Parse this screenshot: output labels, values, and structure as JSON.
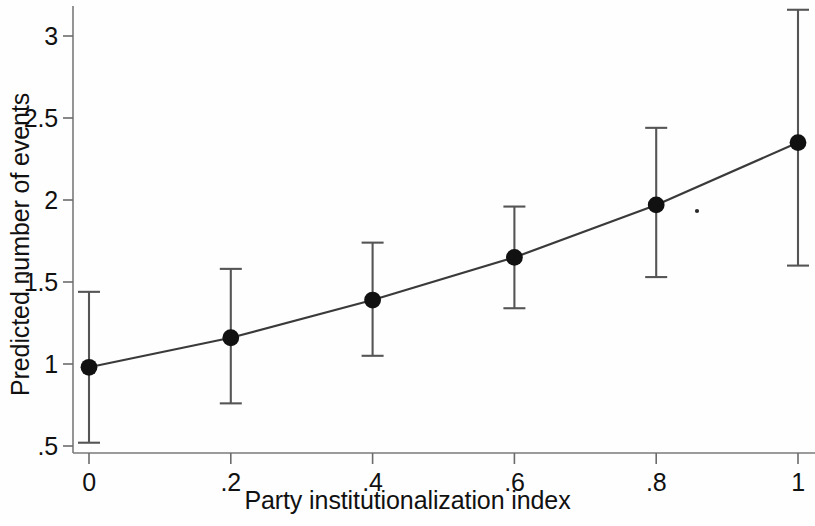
{
  "chart_data": {
    "type": "line",
    "title": "",
    "subtitle": "",
    "xlabel": "Party institutionalization index",
    "ylabel": "Predicted number of events",
    "x": [
      0,
      0.2,
      0.4,
      0.6,
      0.8,
      1
    ],
    "xtick_labels": [
      "0",
      ".2",
      ".4",
      ".6",
      ".8",
      "1"
    ],
    "ytick_labels": [
      ".5",
      "1",
      "1.5",
      "2",
      "2.5",
      "3"
    ],
    "ytick_values": [
      0.5,
      1,
      1.5,
      2,
      2.5,
      3
    ],
    "values": [
      0.98,
      1.16,
      1.39,
      1.65,
      1.97,
      2.35
    ],
    "error_low": [
      0.52,
      0.76,
      1.05,
      1.34,
      1.53,
      1.6
    ],
    "error_high": [
      1.44,
      1.58,
      1.74,
      1.96,
      2.44,
      3.16
    ],
    "xlim": [
      -0.055,
      1.04
    ],
    "ylim": [
      0.44,
      3.2
    ],
    "grid": false,
    "legend": null,
    "marker": "filled-circle",
    "series": [
      {
        "name": "Predicted number of events",
        "values": [
          0.98,
          1.16,
          1.39,
          1.65,
          1.97,
          2.35
        ],
        "error_low": [
          0.52,
          0.76,
          1.05,
          1.34,
          1.53,
          1.6
        ],
        "error_high": [
          1.44,
          1.58,
          1.74,
          1.96,
          2.44,
          3.16
        ]
      }
    ],
    "colors": {
      "line": "#3a3a3a",
      "marker": "#111111",
      "error_bar": "#555555",
      "axis": "#6b6b6b",
      "background": "#fefefe"
    }
  }
}
